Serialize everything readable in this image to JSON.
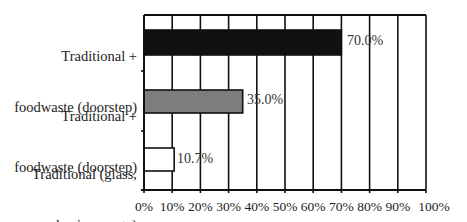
{
  "chart_data": {
    "type": "bar",
    "orientation": "horizontal",
    "title": "",
    "xlabel": "",
    "ylabel": "",
    "categories": [
      "Traditional +\nfoodwaste (doorstep)",
      "Traditional +\nfoodwaste (doorstep)",
      "Traditional (glass,\npaper, packaging waste)"
    ],
    "values": [
      70.0,
      35.0,
      10.7
    ],
    "value_labels": [
      "70.0%",
      "35.0%",
      "10.7%"
    ],
    "bar_colors": [
      "#111111",
      "#7d7d7d",
      "#ffffff"
    ],
    "xlim": [
      0,
      100
    ],
    "x_ticks": [
      "0%",
      "10%",
      "20%",
      "30%",
      "40%",
      "50%",
      "60%",
      "70%",
      "80%",
      "90%",
      "100%"
    ],
    "grid": {
      "vertical": true,
      "horizontal": false
    },
    "legend": null
  },
  "labels": {
    "cat0_line1": "Traditional +",
    "cat0_line2": "foodwaste (doorstep)",
    "cat1_line1": "Traditional +",
    "cat1_line2": "foodwaste (doorstep)",
    "cat2_line1": "Traditional (glass,",
    "cat2_line2": "paper, packaging waste)",
    "val0": "70.0%",
    "val1": "35.0%",
    "val2": "10.7%",
    "ticks": [
      "0%",
      "10%",
      "20%",
      "30%",
      "40%",
      "50%",
      "60%",
      "70%",
      "80%",
      "90%",
      "100%"
    ]
  }
}
